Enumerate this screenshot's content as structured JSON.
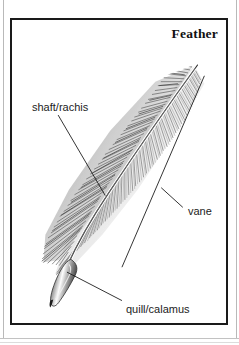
{
  "plate": {
    "title": "Feather",
    "title_icon": "none"
  },
  "labels": {
    "shaft": "shaft/rachis",
    "vane": "vane",
    "quill": "quill/calamus"
  },
  "illustration": {
    "subject": "feather-illustration",
    "style": "pen-and-ink hatching",
    "parts": [
      "quill/calamus",
      "shaft/rachis",
      "vane"
    ]
  },
  "colors": {
    "ink": "#1a1a1a",
    "paper": "#ffffff",
    "barb_gray": "#8a8a8a",
    "frame": "#1a1a1a",
    "page_edge": "#b9b9b9"
  }
}
